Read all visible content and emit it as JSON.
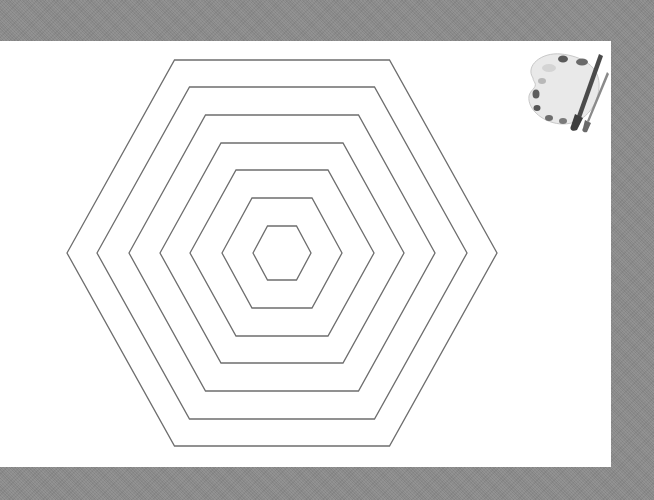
{
  "scene": {
    "background_color": "#8b8b8b",
    "canvas_color": "#ffffff",
    "stroke_color": "#6e6e6e",
    "hexagons": {
      "center": [
        282,
        253
      ],
      "rings": [
        {
          "half_width": 29,
          "half_height": 27
        },
        {
          "half_width": 60,
          "half_height": 55
        },
        {
          "half_width": 92,
          "half_height": 83
        },
        {
          "half_width": 122,
          "half_height": 110
        },
        {
          "half_width": 153,
          "half_height": 138
        },
        {
          "half_width": 185,
          "half_height": 166
        },
        {
          "half_width": 215,
          "half_height": 193
        }
      ]
    },
    "palette_icon": {
      "name": "paint-palette-icon",
      "position": [
        519,
        48
      ],
      "size": [
        90,
        85
      ]
    }
  }
}
